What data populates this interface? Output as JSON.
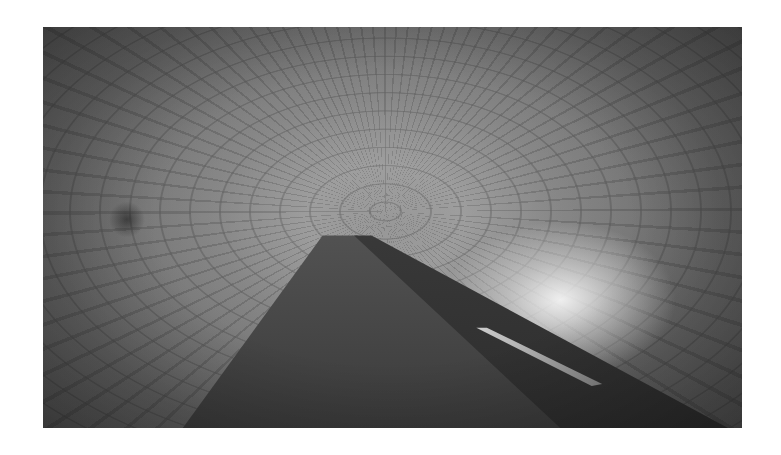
{
  "image": {
    "subject": "Grayscale photograph of a vaulted brick tunnel with a water channel and lit walkway receding into a bright arched vanishing point",
    "color_mode": "grayscale",
    "colors": {
      "background": "#ffffff",
      "mid_tone": "#7e7e7e",
      "dark_tone": "#3e3e3e",
      "highlight": "#f0f0f0"
    },
    "frame": {
      "left": 43,
      "top": 27,
      "width": 699,
      "height": 401
    }
  }
}
